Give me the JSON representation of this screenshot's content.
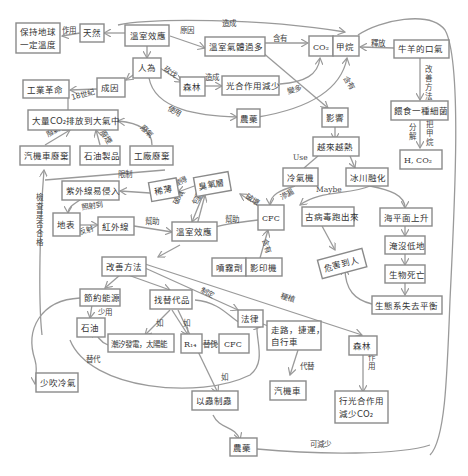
{
  "diagram": {
    "colors": {
      "stroke": "#8a8a8a",
      "text": "#333333",
      "edge": "#9a9a9a",
      "background": "#ffffff"
    },
    "nodes": {
      "greenhouse_top": "溫室效應",
      "natural": "天然",
      "keep_temp_1": "保持地球",
      "keep_temp_2": "一定溫度",
      "gas_excess": "溫室氣體過多",
      "co2": "CO₂",
      "methane": "甲烷",
      "cattle_breath": "牛羊的口氣",
      "human": "人為",
      "forest_top": "森林",
      "photosynthesis_less": "光合作用減少",
      "cause": "成因",
      "industrial_rev": "工業革命",
      "pesticide_top": "農藥",
      "feed_bacteria": "餵食一種細菌",
      "h_co2": "H, CO₂",
      "co2_emission": "大量CO₂排放到大氣中",
      "influence": "影響",
      "hotter": "越來越熱",
      "car_exhaust": "汽機車廢棄",
      "petroleum_products": "石油製品",
      "factory_waste": "工廠廢棄",
      "aircon": "冷氣機",
      "glacier_melt": "冰川融化",
      "uv_invade": "紫外線易侵入",
      "thin": "稀薄",
      "ozone": "臭氧層",
      "cfc_mid": "CFC",
      "ancient_virus": "古病毒跑出來",
      "sea_rise": "海平面上升",
      "ground": "地表",
      "infrared": "紅外線",
      "greenhouse_mid": "溫室效應",
      "spray": "噴霧劑",
      "copier": "影印機",
      "harm_people": "危害到人",
      "flood_lowland": "淹沒低地",
      "bio_death": "生物死亡",
      "eco_imbalance": "生態系失去平衡",
      "improve": "改善方法",
      "save_energy": "節約能源",
      "find_alt": "找替代品",
      "law": "法律",
      "walk_1": "走路，捷運，",
      "walk_2": "自行車",
      "forest_bottom": "森林",
      "oil": "石油",
      "tidal_solar": "潮汐發電，太陽能",
      "r14": "R₁₄",
      "cfc_bottom": "CFC",
      "car": "汽機車",
      "photo_reduce_1": "行光合作用",
      "photo_reduce_2": "減少CO₂",
      "less_ac": "少吹冷氣",
      "bio_control": "以蟲制蟲",
      "pesticide_bottom": "農藥"
    },
    "edge_labels": {
      "cause_top": "造成",
      "reason": "原因",
      "effect": "作用",
      "contains": "含有",
      "release": "釋放",
      "improve_method": "改善方法",
      "logging": "砍伐",
      "causes": "造成",
      "became_more": "變多",
      "contains2": "含有",
      "century": "18世紀",
      "use": "使用",
      "decompose": "分解",
      "methane_to": "把甲烷",
      "exhaust": "廢氣",
      "smoke": "廢煙",
      "exhaust2": "廢氣",
      "use_en": "Use",
      "maybe": "Maybe",
      "limit": "限制",
      "destroy": "破壞",
      "leak": "滲漏",
      "become_thin": "變得",
      "damage": "破壞",
      "surround": "包圍",
      "shine_to": "照射到",
      "reflect": "反射",
      "help": "幫助",
      "help2": "幫助",
      "contains3": "含有",
      "check": "檢查是否合格",
      "establish": "制定",
      "plant": "種植",
      "less_use": "少用",
      "such_as": "如",
      "such_as2": "如",
      "such_as3": "如",
      "replace": "替代",
      "replace2": "替代",
      "replace3": "代替",
      "function": "作用",
      "can_reduce": "可減少"
    }
  }
}
